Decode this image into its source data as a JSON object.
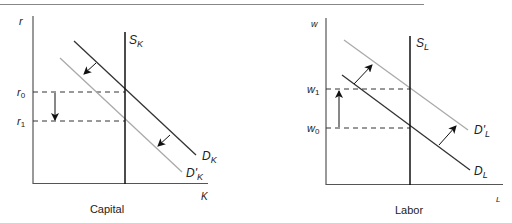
{
  "panels": [
    {
      "title": "Capital",
      "y_axis_label": "r",
      "x_axis_label": "K",
      "supply_label": {
        "main": "S",
        "sub": "K"
      },
      "demand_label": {
        "main": "D",
        "sub": "K"
      },
      "demand_new_label": {
        "main": "D'",
        "sub": "K"
      },
      "price_levels": [
        {
          "main": "r",
          "sub": "0"
        },
        {
          "main": "r",
          "sub": "1"
        }
      ],
      "shift": "left"
    },
    {
      "title": "Labor",
      "y_axis_label": "w",
      "x_axis_label": "L",
      "supply_label": {
        "main": "S",
        "sub": "L"
      },
      "demand_label": {
        "main": "D",
        "sub": "L"
      },
      "demand_new_label": {
        "main": "D'",
        "sub": "L"
      },
      "price_levels": [
        {
          "main": "w",
          "sub": "1"
        },
        {
          "main": "w",
          "sub": "0"
        }
      ],
      "shift": "right"
    }
  ],
  "colors": {
    "axis": "#555555",
    "original_curve": "#333333",
    "shifted_curve": "#aaaaaa",
    "supply": "#111111",
    "top_rule": "#888888"
  }
}
